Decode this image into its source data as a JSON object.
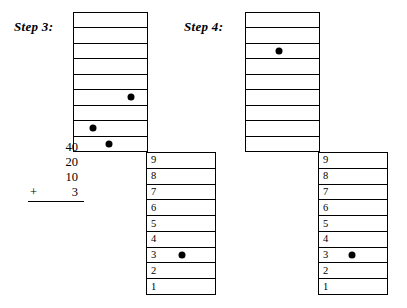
{
  "figure": {
    "type": "abacus-place-value-diagram",
    "dot_color": "#000000",
    "line_color": "#000000",
    "background": "#ffffff"
  },
  "steps": [
    {
      "id": "step3",
      "label": "Step 3:",
      "upper_grid": {
        "rows": 9,
        "row_labels": [
          "",
          "",
          "",
          "",
          "",
          "",
          "",
          "",
          ""
        ],
        "dots": [
          {
            "row_index": 5,
            "x_percent": 78
          },
          {
            "row_index": 7,
            "x_percent": 26
          },
          {
            "row_index": 8,
            "x_percent": 48
          }
        ]
      },
      "lower_grid": {
        "rows": 9,
        "row_labels": [
          "9",
          "8",
          "7",
          "6",
          "5",
          "4",
          "3",
          "2",
          "1"
        ],
        "dots": [
          {
            "row_index": 6,
            "x_percent": 52
          }
        ]
      }
    },
    {
      "id": "step4",
      "label": "Step 4:",
      "upper_grid": {
        "rows": 9,
        "row_labels": [
          "",
          "",
          "",
          "",
          "",
          "",
          "",
          "",
          ""
        ],
        "dots": [
          {
            "row_index": 2,
            "x_percent": 45
          }
        ]
      },
      "lower_grid": {
        "rows": 9,
        "row_labels": [
          "9",
          "8",
          "7",
          "6",
          "5",
          "4",
          "3",
          "2",
          "1"
        ],
        "dots": [
          {
            "row_index": 6,
            "x_percent": 48
          }
        ]
      }
    }
  ],
  "addition": {
    "addends": [
      "40",
      "20",
      "10"
    ],
    "operator": "+",
    "final_addend": "3",
    "has_rule": true
  }
}
